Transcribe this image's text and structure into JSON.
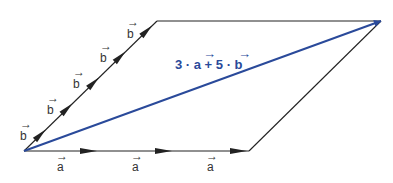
{
  "diagram": {
    "colors": {
      "line": "#222222",
      "result": "#2a4a9a",
      "label": "#333333"
    },
    "vector_a_labels": [
      "a",
      "a",
      "a"
    ],
    "vector_b_labels": [
      "b",
      "b",
      "b",
      "b",
      "b"
    ],
    "result_label": "3 · a + 5 · b",
    "result_label_parts": {
      "c1": "3",
      "dot1": "·",
      "v1": "a",
      "plus": "+",
      "c2": "5",
      "dot2": "·",
      "v2": "b"
    },
    "vector_mark": "→"
  }
}
